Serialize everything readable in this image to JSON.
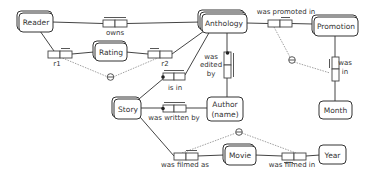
{
  "diagram": {
    "type": "ORM fact-type diagram",
    "entities": [
      {
        "id": "reader",
        "label": "Reader"
      },
      {
        "id": "rating",
        "label": "Rating"
      },
      {
        "id": "anthology",
        "label": "Anthology"
      },
      {
        "id": "promotion",
        "label": "Promotion"
      },
      {
        "id": "month",
        "label": "Month"
      },
      {
        "id": "story",
        "label": "Story"
      },
      {
        "id": "author",
        "label": "Author",
        "label2": "(name)"
      },
      {
        "id": "movie",
        "label": "Movie"
      },
      {
        "id": "year",
        "label": "Year"
      }
    ],
    "roles": {
      "owns": "owns",
      "r1": "r1",
      "r2": "r2",
      "was_promoted_in": "was promoted in",
      "was_edited_by": [
        "was",
        "edited",
        "by"
      ],
      "was_in": [
        "was",
        "in"
      ],
      "is_in": "is in",
      "was_written_by": "was written by",
      "was_filmed_as": "was filmed as",
      "was_filmed_in": "was filmed in"
    },
    "constraints": [
      {
        "type": "exclusion",
        "between": [
          "r1",
          "r2"
        ]
      },
      {
        "type": "exclusion",
        "between": [
          "was promoted in",
          "was in"
        ]
      },
      {
        "type": "exclusion",
        "between": [
          "was filmed as",
          "was filmed in"
        ]
      }
    ]
  },
  "colors": {
    "stroke": "#333333",
    "background": "#ffffff",
    "constraint": "#777777"
  }
}
